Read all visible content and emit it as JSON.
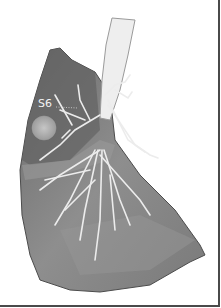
{
  "figure": {
    "segment_label": "S6",
    "colors": {
      "background": "#ffffff",
      "lung_surface": "#8a8a8a",
      "lung_dark": "#5a5a5a",
      "airway": "#f0f0f0",
      "nodule": "#b9b9b9",
      "frame": "#4a4a4a"
    }
  }
}
